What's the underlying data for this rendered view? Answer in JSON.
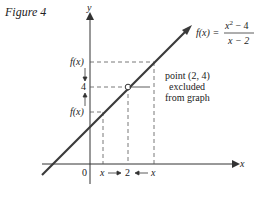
{
  "figure": {
    "label": "Figure 4",
    "axes": {
      "x_label": "x",
      "y_label": "y",
      "origin_label": "0"
    },
    "y_ticks": {
      "top": "f(x)",
      "middle": "4",
      "bottom": "f(x)"
    },
    "x_ticks": {
      "left": "x",
      "middle": "2",
      "right": "x"
    },
    "function": {
      "lhs": "f(x) =",
      "numerator": "x² − 4",
      "numerator_base": "x",
      "numerator_exp": "2",
      "numerator_rest": " − 4",
      "denominator": "x − 2"
    },
    "annotation": [
      "point (2, 4)",
      "excluded",
      "from graph"
    ],
    "colors": {
      "line": "#3a3a3a",
      "axis": "#333333",
      "dash": "#555555",
      "text": "#222222"
    }
  }
}
